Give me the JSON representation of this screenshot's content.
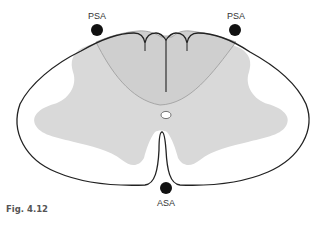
{
  "figure": {
    "caption": "Fig. 4.12",
    "labels": {
      "psa_left": "PSA",
      "psa_right": "PSA",
      "asa": "ASA"
    },
    "colors": {
      "outline": "#222222",
      "white_matter": "#ffffff",
      "gray_matter": "#d9d9d9",
      "dorsal_region": "#cfcfcf",
      "artery_dot": "#111111",
      "label_text": "#333333"
    }
  }
}
